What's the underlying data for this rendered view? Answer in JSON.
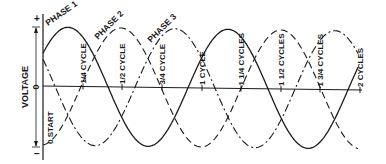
{
  "diagram": {
    "type": "three-phase-waveform",
    "y_axis": {
      "label": "VOLTAGE",
      "plus_label": "+",
      "zero_label": "0",
      "minus_label": "−"
    },
    "phases": [
      {
        "name": "PHASE 1",
        "style": "solid",
        "peak_x": 68
      },
      {
        "name": "PHASE 2",
        "style": "dashed",
        "peak_x": 121
      },
      {
        "name": "PHASE 3",
        "style": "dash-dot",
        "peak_x": 175
      }
    ],
    "tick_labels": [
      {
        "label": "0 START",
        "x": 43
      },
      {
        "label": "1/4 CYCLE",
        "x": 83
      },
      {
        "label": "1/2 CYCLE",
        "x": 122
      },
      {
        "label": "3/4 CYCLE",
        "x": 162
      },
      {
        "label": "1 CYCLE",
        "x": 202
      },
      {
        "label": "1 1/4 CYCLES",
        "x": 241
      },
      {
        "label": "1 1/2 CYCLES",
        "x": 281
      },
      {
        "label": "1 3/4 CYCLES",
        "x": 320
      },
      {
        "label": "2 CYCLES",
        "x": 360
      }
    ],
    "geometry": {
      "x_start": 43,
      "x_end": 358,
      "zero_y": 87,
      "amplitude": 59,
      "period": 160
    },
    "colors": {
      "ink": "#1a1a1a",
      "background": "#ffffff"
    }
  }
}
